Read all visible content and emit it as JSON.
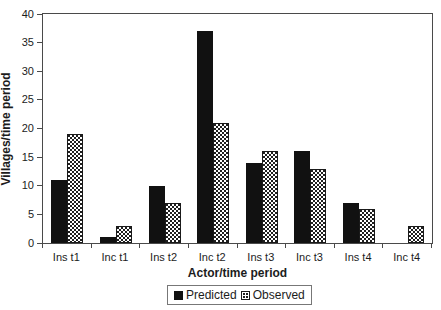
{
  "chart_data": {
    "type": "bar",
    "title": "",
    "xlabel": "Actor/time period",
    "ylabel": "Villages/time period",
    "ylim": [
      0,
      40
    ],
    "ytick_step": 5,
    "grid": false,
    "legend_position": "bottom-center",
    "categories": [
      "Ins t1",
      "Inc t1",
      "Ins t2",
      "Inc t2",
      "Ins t3",
      "Inc t3",
      "Ins t4",
      "Inc t4"
    ],
    "series": [
      {
        "name": "Predicted",
        "style": "solid-black",
        "values": [
          11,
          1,
          10,
          37,
          14,
          16,
          7,
          0
        ]
      },
      {
        "name": "Observed",
        "style": "stippled-white",
        "values": [
          19,
          3,
          7,
          21,
          16,
          13,
          6,
          3
        ]
      }
    ],
    "colors": {
      "predicted_fill": "#111111",
      "observed_fill": "#ffffff",
      "observed_dots": "#1a1a1a",
      "axis": "#4a4a4a",
      "text": "#1c1c1c",
      "background": "#ffffff"
    }
  }
}
